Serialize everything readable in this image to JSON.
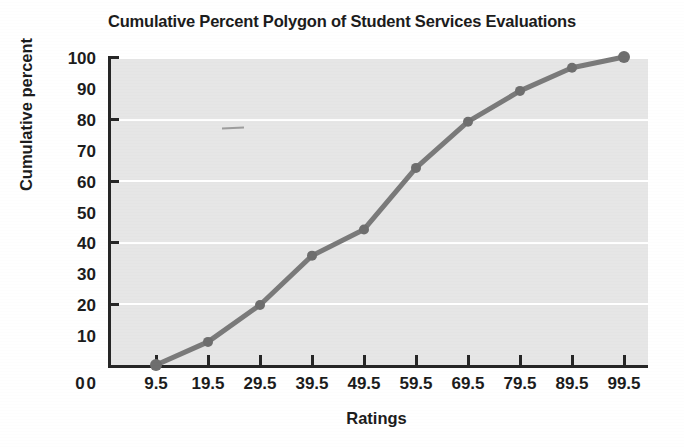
{
  "chart_data": {
    "type": "line",
    "title": "Cumulative Percent Polygon of Student Services Evaluations",
    "xlabel": "Ratings",
    "ylabel": "Cumulative percent",
    "x": [
      9.5,
      19.5,
      29.5,
      39.5,
      49.5,
      59.5,
      69.5,
      79.5,
      89.5,
      99.5
    ],
    "values": [
      0,
      7.5,
      19.5,
      35.5,
      44,
      64,
      79,
      89,
      96.5,
      100
    ],
    "series": [
      {
        "name": "Cumulative percent",
        "values": [
          0,
          7.5,
          19.5,
          35.5,
          44,
          64,
          79,
          89,
          96.5,
          100
        ]
      }
    ],
    "xtick_labels": [
      "0",
      "9.5",
      "19.5",
      "29.5",
      "39.5",
      "49.5",
      "59.5",
      "69.5",
      "79.5",
      "89.5",
      "99.5"
    ],
    "ytick_labels": [
      "0",
      "10",
      "20",
      "30",
      "40",
      "50",
      "60",
      "70",
      "80",
      "90",
      "100"
    ],
    "ytick_values": [
      0,
      10,
      20,
      30,
      40,
      50,
      60,
      70,
      80,
      90,
      100
    ],
    "ylim": [
      0,
      100
    ],
    "xlim": [
      0,
      104.5
    ],
    "grid": "horizontal-white-gridlines",
    "legend": "none",
    "marker": "filled-circle",
    "line_color": "#7a7a7a",
    "marker_color": "#6e6e6e",
    "plot_background": "#e6e6e6",
    "axis_color": "#262626",
    "gridline_color": "#ffffff"
  }
}
